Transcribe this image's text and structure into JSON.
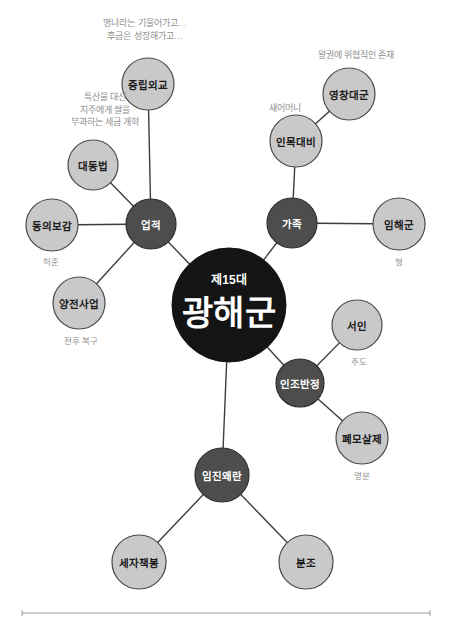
{
  "diagram": {
    "type": "mind-map",
    "title": "광해군",
    "center": {
      "id": "gwanghaegun",
      "superscript": "제15대",
      "label": "광해군",
      "cx": 229,
      "cy": 305,
      "r": 57,
      "color": "#141414"
    },
    "colors": {
      "branch_node": "#4d4d4d",
      "leaf_node": "#c9c9c9",
      "center_node": "#141414",
      "edge": "#3d3d3d",
      "annotation": "#8f8f8f",
      "background": "#ffffff"
    },
    "branches": [
      {
        "id": "eopjeok",
        "label": "업적",
        "cx": 151,
        "cy": 224,
        "r": 25,
        "kind": "branch",
        "children": [
          {
            "id": "jungnipoegyo",
            "label": "중립외교",
            "cx": 148,
            "cy": 84,
            "r": 26,
            "kind": "leaf",
            "annotation": [
              "명나라는 기울어가고…",
              "후금은 성장해가고…"
            ],
            "annotation_x": 145,
            "annotation_y": 23
          },
          {
            "id": "daedongbeop",
            "label": "대동법",
            "cx": 93,
            "cy": 165,
            "r": 25,
            "kind": "leaf",
            "annotation": [
              "특산물 대신",
              "지주에게 쌀을",
              "부과하는 세금 개혁"
            ],
            "annotation_x": 105,
            "annotation_y": 97
          },
          {
            "id": "donguibogam",
            "label": "동의보감",
            "cx": 52,
            "cy": 225,
            "r": 26,
            "kind": "leaf",
            "caption": "허준",
            "caption_x": 51,
            "caption_y": 262
          },
          {
            "id": "yangjeonsaeop",
            "label": "양전사업",
            "cx": 79,
            "cy": 303,
            "r": 26,
            "kind": "leaf",
            "caption": "전후 복구",
            "caption_x": 81,
            "caption_y": 341
          }
        ]
      },
      {
        "id": "gajok",
        "label": "가족",
        "cx": 292,
        "cy": 223,
        "r": 25,
        "kind": "branch",
        "children": [
          {
            "id": "inmokdaebi",
            "label": "인목대비",
            "cx": 296,
            "cy": 141,
            "r": 26,
            "kind": "leaf",
            "annotation": [
              "새어머니"
            ],
            "annotation_x": 285,
            "annotation_y": 108
          },
          {
            "id": "yeongchangdaegun",
            "label": "영창대군",
            "cx": 349,
            "cy": 94,
            "r": 26,
            "kind": "leaf",
            "annotation": [
              "왕권에 위협적인 존재"
            ],
            "annotation_x": 356,
            "annotation_y": 55
          },
          {
            "id": "imhaegun",
            "label": "임해군",
            "cx": 399,
            "cy": 224,
            "r": 26,
            "kind": "leaf",
            "caption": "형",
            "caption_x": 399,
            "caption_y": 262
          }
        ]
      },
      {
        "id": "injobanjeong",
        "label": "인조반정",
        "cx": 300,
        "cy": 383,
        "r": 24,
        "kind": "branch",
        "children": [
          {
            "id": "seoin",
            "label": "서인",
            "cx": 357,
            "cy": 325,
            "r": 25,
            "kind": "leaf",
            "caption": "주도",
            "caption_x": 359,
            "caption_y": 362
          },
          {
            "id": "pyemosalje",
            "label": "폐모살제",
            "cx": 362,
            "cy": 438,
            "r": 26,
            "kind": "leaf",
            "caption": "명분",
            "caption_x": 362,
            "caption_y": 476
          }
        ]
      },
      {
        "id": "imjinwaeran",
        "label": "임진왜란",
        "cx": 222,
        "cy": 475,
        "r": 27,
        "kind": "branch",
        "children": [
          {
            "id": "sejachaekbong",
            "label": "세자책봉",
            "cx": 139,
            "cy": 562,
            "r": 27,
            "kind": "leaf"
          },
          {
            "id": "bunjo",
            "label": "분조",
            "cx": 306,
            "cy": 562,
            "r": 27,
            "kind": "leaf"
          }
        ]
      }
    ],
    "footer_rule": {
      "x1": 22,
      "x2": 430,
      "y": 613
    }
  }
}
